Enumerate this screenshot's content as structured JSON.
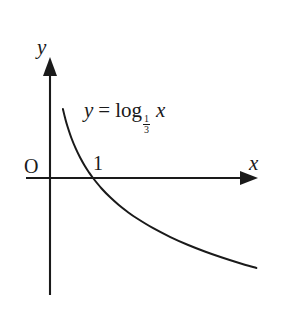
{
  "figure": {
    "background_color": "#ffffff",
    "stroke_color": "#1a1a1a"
  },
  "axes": {
    "x_axis_label": "x",
    "y_axis_label": "y",
    "origin_label": "O",
    "x_tick_label": "1",
    "x_axis_arrow": "arrow-right",
    "y_axis_arrow": "arrow-up"
  },
  "equation": {
    "lhs": "y",
    "operator": "=",
    "function_name": "log",
    "base_numerator": "1",
    "base_denominator": "3",
    "argument": "x",
    "full_text": "y = log_(1/3) x"
  },
  "chart_data": {
    "type": "line",
    "xlabel": "x",
    "ylabel": "y",
    "grid": false,
    "legend": null,
    "annotations": [
      {
        "text": "O",
        "x": 0,
        "y": 0,
        "role": "origin-label"
      },
      {
        "text": "1",
        "x": 1,
        "y": 0,
        "role": "x-intercept-label"
      },
      {
        "text": "y = log_(1/3) x",
        "x": 2.0,
        "y": 1.1,
        "role": "curve-equation"
      }
    ],
    "series": [
      {
        "name": "y = log_(1/3) x",
        "base": 0.3333333333,
        "x": [
          0.3,
          0.35,
          0.4,
          0.5,
          0.6,
          0.7,
          0.8,
          0.9,
          1.0,
          1.2,
          1.4,
          1.6,
          1.8,
          2.0,
          2.4,
          2.8,
          3.2,
          3.6,
          4.0,
          4.4,
          4.8
        ],
        "y": [
          1.096,
          0.955,
          0.834,
          0.631,
          0.465,
          0.325,
          0.203,
          0.096,
          0.0,
          -0.166,
          -0.306,
          -0.428,
          -0.535,
          -0.631,
          -0.797,
          -0.937,
          -1.059,
          -1.166,
          -1.262,
          -1.349,
          -1.428
        ]
      }
    ],
    "xlim": [
      -0.55,
      4.85
    ],
    "ylim": [
      -1.86,
      1.9
    ],
    "x_ticks": [
      1
    ],
    "x_tick_labels": [
      "1"
    ],
    "y_ticks": [],
    "y_tick_labels": []
  },
  "geometry": {
    "origin_px": {
      "x": 50,
      "y": 178
    },
    "unit_px_x": 43,
    "unit_px_y": 63,
    "x_axis_start_px": 26,
    "x_axis_end_px": 258,
    "y_axis_top_px": 58,
    "y_axis_bottom_px": 295,
    "curve_path": "M 62.5,58 C 66,84 72,118 80,144 C 85,161 89,171 93.1,178 C 99,188 107,201 117,214 C 133,235 152,254 172,270 C 192,285 215,293 235,291"
  }
}
